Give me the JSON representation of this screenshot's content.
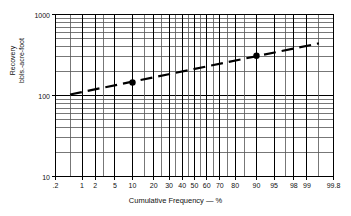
{
  "chart_data": {
    "type": "line",
    "title": "",
    "subtitle": "",
    "xlabel": "Cumulative Frequency — %",
    "ylabel_line1": "Recovery",
    "ylabel_line2": "bbls.-acre-foot",
    "x_scale": "probability",
    "y_scale": "log",
    "xlim": [
      0.2,
      99.8
    ],
    "ylim": [
      10,
      1000
    ],
    "grid": true,
    "legend": "none",
    "x_ticks": [
      {
        "value": 0.2,
        "label": ".2"
      },
      {
        "value": 1,
        "label": "1"
      },
      {
        "value": 2,
        "label": "2"
      },
      {
        "value": 5,
        "label": "5"
      },
      {
        "value": 10,
        "label": "10"
      },
      {
        "value": 20,
        "label": "20"
      },
      {
        "value": 30,
        "label": "30"
      },
      {
        "value": 40,
        "label": "40"
      },
      {
        "value": 50,
        "label": "50"
      },
      {
        "value": 60,
        "label": "60"
      },
      {
        "value": 70,
        "label": "70"
      },
      {
        "value": 80,
        "label": "80"
      },
      {
        "value": 90,
        "label": "90"
      },
      {
        "value": 95,
        "label": "95"
      },
      {
        "value": 98,
        "label": "98"
      },
      {
        "value": 99,
        "label": "99"
      },
      {
        "value": 99.8,
        "label": "99.8"
      }
    ],
    "y_ticks": [
      {
        "value": 10,
        "label": "10"
      },
      {
        "value": 100,
        "label": "100"
      },
      {
        "value": 1000,
        "label": "1000"
      }
    ],
    "y_minor_ticks": [
      20,
      30,
      40,
      50,
      60,
      70,
      80,
      90,
      200,
      300,
      400,
      500,
      600,
      700,
      800,
      900
    ],
    "x_minor_ticks": [
      0.5,
      3,
      15,
      25,
      35,
      45,
      55,
      65,
      75,
      85,
      97,
      99.5
    ],
    "series": [
      {
        "name": "Recovery trend",
        "style": "dashed",
        "color": "#000000",
        "x": [
          0.5,
          99.5
        ],
        "y": [
          103,
          440
        ]
      }
    ],
    "points": [
      {
        "x": 10,
        "y": 145,
        "marker": "filled-circle",
        "color": "#000000"
      },
      {
        "x": 90,
        "y": 310,
        "marker": "filled-circle",
        "color": "#000000"
      }
    ],
    "colors": {
      "grid": "#555555",
      "axis": "#000000",
      "data": "#000000",
      "background": "#ffffff"
    }
  }
}
